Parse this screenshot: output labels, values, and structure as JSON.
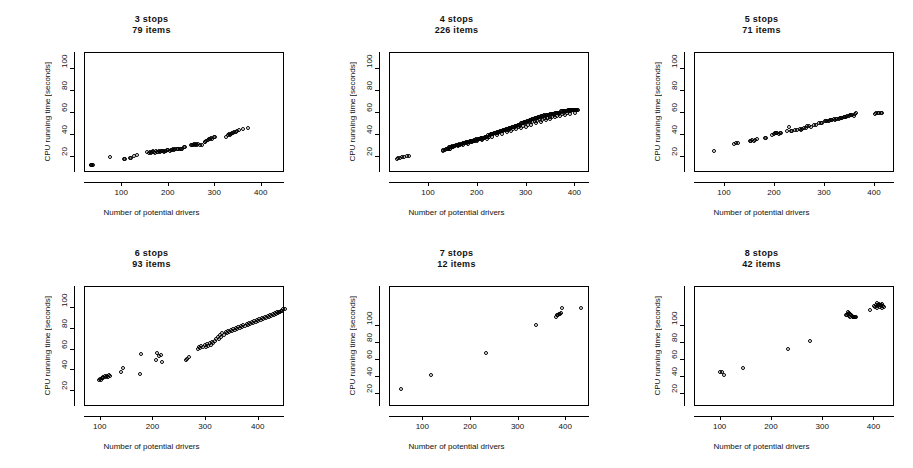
{
  "figure": {
    "width": 913,
    "height": 468,
    "background": "#ffffff",
    "foreground": "#000000",
    "layout": "2 rows x 3 columns of scatter panels"
  },
  "common": {
    "xlabel": "Number of potential drivers",
    "ylabel": "CPU running time [seconds]",
    "xticks": [
      "100",
      "200",
      "300",
      "400"
    ],
    "xtick_values": [
      100,
      200,
      300,
      400
    ],
    "marker": "open-circle"
  },
  "chart_data": [
    {
      "type": "scatter",
      "title": "3 stops",
      "subtitle": "79 items",
      "stops": 3,
      "items": 79,
      "xlabel": "Number of potential drivers",
      "ylabel": "CPU running time [seconds]",
      "xlim": [
        20,
        450
      ],
      "ylim": [
        5,
        115
      ],
      "xticks": [
        100,
        200,
        300,
        400
      ],
      "yticks": [
        20,
        40,
        60,
        80,
        100
      ],
      "ytick_labels": [
        "20",
        "40",
        "60",
        "80",
        "100"
      ],
      "grid": false,
      "legend": "none",
      "x": [
        33,
        35,
        36,
        38,
        75,
        105,
        108,
        118,
        120,
        126,
        132,
        155,
        158,
        160,
        163,
        165,
        168,
        170,
        172,
        174,
        176,
        178,
        180,
        182,
        184,
        186,
        188,
        190,
        192,
        195,
        197,
        200,
        203,
        206,
        208,
        210,
        213,
        215,
        218,
        220,
        222,
        225,
        228,
        230,
        233,
        235,
        250,
        252,
        254,
        256,
        258,
        260,
        262,
        265,
        268,
        272,
        278,
        280,
        282,
        285,
        288,
        290,
        292,
        295,
        298,
        300,
        325,
        328,
        330,
        332,
        335,
        338,
        340,
        342,
        345,
        348,
        352,
        360,
        372
      ],
      "y": [
        12,
        12,
        12,
        12,
        19,
        17,
        17,
        18,
        18,
        20,
        21,
        24,
        23,
        24,
        23,
        24,
        25,
        24,
        23,
        25,
        24,
        24,
        25,
        24,
        25,
        25,
        25,
        24,
        25,
        25,
        26,
        26,
        25,
        26,
        26,
        27,
        26,
        27,
        27,
        27,
        27,
        27,
        27,
        27,
        28,
        28,
        30,
        30,
        30,
        31,
        30,
        31,
        30,
        31,
        30,
        30,
        33,
        33,
        34,
        35,
        36,
        36,
        37,
        36,
        38,
        38,
        38,
        39,
        40,
        39,
        40,
        41,
        41,
        42,
        42,
        43,
        44,
        45,
        46
      ]
    },
    {
      "type": "scatter",
      "title": "4 stops",
      "subtitle": "226 items",
      "stops": 4,
      "items": 226,
      "xlabel": "Number of potential drivers",
      "ylabel": "CPU running time [seconds]",
      "xlim": [
        20,
        430
      ],
      "ylim": [
        5,
        115
      ],
      "xticks": [
        100,
        200,
        300,
        400
      ],
      "yticks": [
        20,
        40,
        60,
        80,
        100
      ],
      "ytick_labels": [
        "20",
        "40",
        "60",
        "80",
        "100"
      ],
      "grid": false,
      "legend": "none",
      "x": [
        35,
        38,
        42,
        45,
        50,
        55,
        60,
        130,
        133,
        135,
        137,
        139,
        141,
        143,
        145,
        147,
        149,
        151,
        153,
        155,
        157,
        159,
        161,
        163,
        165,
        167,
        169,
        171,
        173,
        175,
        177,
        179,
        181,
        183,
        185,
        187,
        189,
        191,
        193,
        195,
        197,
        199,
        201,
        203,
        205,
        207,
        209,
        211,
        213,
        215,
        217,
        219,
        221,
        223,
        225,
        227,
        229,
        231,
        233,
        235,
        237,
        239,
        241,
        243,
        245,
        247,
        249,
        251,
        253,
        255,
        257,
        259,
        261,
        263,
        265,
        267,
        269,
        271,
        273,
        275,
        277,
        279,
        281,
        283,
        285,
        287,
        289,
        291,
        293,
        295,
        297,
        299,
        301,
        303,
        305,
        307,
        309,
        311,
        313,
        315,
        317,
        319,
        321,
        323,
        325,
        327,
        329,
        331,
        333,
        335,
        337,
        339,
        341,
        343,
        345,
        347,
        349,
        351,
        353,
        355,
        357,
        359,
        361,
        363,
        365,
        367,
        369,
        371,
        373,
        375,
        377,
        379,
        381,
        383,
        385,
        387,
        389,
        391,
        393,
        395,
        397,
        399,
        401,
        403,
        405,
        407,
        130,
        140,
        150,
        160,
        170,
        180,
        190,
        200,
        210,
        220,
        230,
        240,
        250,
        260,
        270,
        280,
        290,
        300,
        310,
        320,
        330,
        340,
        350,
        360,
        370,
        380,
        390,
        400,
        143,
        153,
        163,
        173,
        183,
        193,
        203,
        213,
        223,
        233,
        243,
        253,
        263,
        273,
        283,
        293,
        303,
        313,
        323,
        333,
        343,
        353,
        363,
        373,
        383,
        393,
        403,
        148,
        158,
        168,
        178,
        188,
        198,
        208,
        218,
        228,
        238,
        248,
        258,
        268,
        278,
        288,
        298,
        308,
        318,
        328,
        338,
        348,
        358,
        368,
        378,
        388,
        398
      ],
      "y": [
        17,
        18,
        18,
        19,
        19,
        20,
        20,
        26,
        26,
        27,
        27,
        27,
        28,
        28,
        27,
        28,
        29,
        28,
        29,
        29,
        30,
        30,
        30,
        31,
        30,
        31,
        31,
        32,
        32,
        32,
        33,
        32,
        33,
        33,
        34,
        33,
        34,
        34,
        35,
        34,
        35,
        35,
        36,
        36,
        36,
        37,
        36,
        37,
        37,
        38,
        38,
        38,
        39,
        38,
        39,
        39,
        40,
        40,
        40,
        41,
        41,
        41,
        42,
        42,
        42,
        43,
        43,
        43,
        44,
        44,
        44,
        45,
        45,
        45,
        46,
        46,
        46,
        47,
        47,
        47,
        48,
        48,
        48,
        49,
        49,
        49,
        50,
        50,
        50,
        51,
        51,
        51,
        52,
        52,
        52,
        53,
        53,
        53,
        54,
        54,
        54,
        55,
        55,
        55,
        56,
        56,
        56,
        57,
        57,
        57,
        58,
        57,
        58,
        58,
        58,
        58,
        59,
        59,
        59,
        59,
        59,
        60,
        60,
        60,
        60,
        60,
        60,
        61,
        61,
        61,
        61,
        61,
        61,
        61,
        62,
        62,
        62,
        62,
        62,
        62,
        62,
        62,
        62,
        62,
        62,
        62,
        25,
        27,
        28,
        29,
        30,
        31,
        33,
        34,
        35,
        36,
        38,
        39,
        40,
        42,
        43,
        45,
        46,
        47,
        49,
        50,
        51,
        53,
        54,
        56,
        57,
        58,
        59,
        60,
        27,
        29,
        30,
        32,
        33,
        34,
        36,
        37,
        38,
        40,
        41,
        43,
        44,
        45,
        47,
        48,
        49,
        51,
        52,
        53,
        55,
        56,
        57,
        59,
        60,
        61,
        62,
        28,
        30,
        31,
        33,
        34,
        36,
        37,
        38,
        40,
        41,
        43,
        44,
        45,
        47,
        48,
        50,
        51,
        52,
        54,
        55,
        56,
        58,
        59,
        60,
        61,
        62
      ]
    },
    {
      "type": "scatter",
      "title": "5 stops",
      "subtitle": "71 items",
      "stops": 5,
      "items": 71,
      "xlabel": "Number of potential drivers",
      "ylabel": "CPU running time [seconds]",
      "xlim": [
        40,
        440
      ],
      "ylim": [
        5,
        115
      ],
      "xticks": [
        100,
        200,
        300,
        400
      ],
      "yticks": [
        20,
        40,
        60,
        80,
        100
      ],
      "ytick_labels": [
        "20",
        "40",
        "60",
        "80",
        "100"
      ],
      "grid": false,
      "legend": "none",
      "x": [
        78,
        118,
        122,
        126,
        150,
        152,
        155,
        158,
        160,
        165,
        180,
        182,
        195,
        198,
        200,
        203,
        205,
        208,
        210,
        212,
        225,
        228,
        232,
        235,
        240,
        245,
        250,
        252,
        255,
        258,
        262,
        265,
        268,
        272,
        278,
        282,
        288,
        292,
        295,
        300,
        302,
        305,
        308,
        310,
        312,
        315,
        318,
        320,
        322,
        325,
        328,
        330,
        332,
        335,
        338,
        340,
        342,
        345,
        348,
        350,
        352,
        355,
        358,
        360,
        362,
        400,
        403,
        406,
        409,
        412,
        415
      ],
      "y": [
        25,
        31,
        32,
        32,
        34,
        34,
        35,
        34,
        35,
        36,
        37,
        37,
        39,
        40,
        41,
        41,
        41,
        40,
        41,
        41,
        43,
        47,
        43,
        43,
        44,
        44,
        45,
        44,
        45,
        46,
        46,
        48,
        48,
        47,
        49,
        49,
        50,
        50,
        50,
        52,
        52,
        52,
        52,
        53,
        53,
        53,
        54,
        53,
        54,
        54,
        54,
        55,
        55,
        55,
        56,
        56,
        56,
        57,
        57,
        58,
        58,
        58,
        57,
        59,
        60,
        59,
        60,
        60,
        60,
        60,
        60
      ]
    },
    {
      "type": "scatter",
      "title": "6 stops",
      "subtitle": "93 items",
      "stops": 6,
      "items": 93,
      "xlabel": "Number of potential drivers",
      "ylabel": "CPU running time [seconds]",
      "xlim": [
        70,
        450
      ],
      "ylim": [
        5,
        120
      ],
      "xticks": [
        100,
        200,
        300,
        400
      ],
      "yticks": [
        20,
        40,
        60,
        80,
        100
      ],
      "ytick_labels": [
        "20",
        "40",
        "60",
        "80",
        "100"
      ],
      "grid": false,
      "legend": "none",
      "x": [
        98,
        100,
        102,
        104,
        105,
        106,
        108,
        110,
        112,
        114,
        116,
        118,
        140,
        143,
        175,
        178,
        205,
        208,
        212,
        215,
        218,
        262,
        265,
        268,
        285,
        288,
        290,
        292,
        295,
        298,
        300,
        303,
        305,
        308,
        310,
        312,
        315,
        318,
        320,
        323,
        325,
        328,
        330,
        332,
        335,
        338,
        340,
        342,
        345,
        348,
        350,
        352,
        355,
        358,
        360,
        362,
        365,
        368,
        370,
        372,
        375,
        378,
        380,
        382,
        385,
        388,
        390,
        392,
        395,
        398,
        400,
        402,
        405,
        408,
        410,
        412,
        415,
        418,
        420,
        422,
        425,
        428,
        430,
        432,
        434,
        436,
        438,
        440,
        442,
        444,
        446,
        448,
        450
      ],
      "y": [
        30,
        31,
        30,
        32,
        33,
        32,
        34,
        33,
        34,
        33,
        35,
        34,
        38,
        42,
        36,
        55,
        50,
        56,
        53,
        54,
        48,
        50,
        51,
        52,
        60,
        62,
        61,
        63,
        62,
        64,
        62,
        65,
        63,
        66,
        64,
        67,
        66,
        68,
        70,
        72,
        70,
        74,
        72,
        75,
        74,
        76,
        75,
        77,
        76,
        78,
        77,
        79,
        78,
        80,
        79,
        81,
        80,
        82,
        81,
        83,
        82,
        84,
        83,
        85,
        84,
        86,
        85,
        87,
        86,
        88,
        87,
        89,
        88,
        90,
        89,
        91,
        90,
        92,
        91,
        93,
        92,
        94,
        93,
        95,
        94,
        96,
        95,
        96,
        96,
        97,
        97,
        98,
        98
      ]
    },
    {
      "type": "scatter",
      "title": "7 stops",
      "subtitle": "12 items",
      "stops": 7,
      "items": 12,
      "xlabel": "Number of potential drivers",
      "ylabel": "CPU running time [seconds]",
      "xlim": [
        30,
        450
      ],
      "ylim": [
        5,
        145
      ],
      "xticks": [
        100,
        200,
        300,
        400
      ],
      "yticks": [
        20,
        40,
        60,
        80,
        100
      ],
      "ytick_labels": [
        "20",
        "40",
        "60",
        "80",
        "100"
      ],
      "grid": false,
      "legend": "none",
      "x": [
        55,
        118,
        232,
        338,
        380,
        382,
        384,
        386,
        388,
        390,
        392,
        432
      ],
      "y": [
        25,
        42,
        68,
        100,
        110,
        112,
        112,
        113,
        113,
        114,
        120,
        120
      ]
    },
    {
      "type": "scatter",
      "title": "8 stops",
      "subtitle": "42 items",
      "stops": 8,
      "items": 42,
      "xlabel": "Number of potential drivers",
      "ylabel": "CPU running time [seconds]",
      "xlim": [
        50,
        440
      ],
      "ylim": [
        5,
        145
      ],
      "xticks": [
        100,
        200,
        300,
        400
      ],
      "yticks": [
        20,
        40,
        60,
        80,
        100
      ],
      "ytick_labels": [
        "20",
        "40",
        "60",
        "80",
        "100"
      ],
      "grid": false,
      "legend": "none",
      "x": [
        100,
        104,
        108,
        144,
        232,
        276,
        345,
        347,
        349,
        351,
        353,
        355,
        357,
        359,
        361,
        363,
        350,
        352,
        354,
        356,
        358,
        360,
        362,
        364,
        392,
        400,
        402,
        404,
        406,
        408,
        410,
        412,
        414,
        416,
        418,
        420,
        405,
        407,
        409,
        411,
        413,
        415
      ],
      "y": [
        45,
        45,
        42,
        50,
        72,
        82,
        112,
        112,
        113,
        111,
        110,
        112,
        111,
        110,
        109,
        110,
        115,
        114,
        113,
        112,
        111,
        110,
        110,
        109,
        118,
        122,
        121,
        123,
        120,
        122,
        124,
        121,
        123,
        120,
        122,
        121,
        126,
        124,
        125,
        123,
        124,
        125
      ]
    }
  ]
}
